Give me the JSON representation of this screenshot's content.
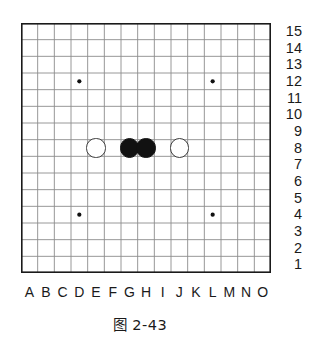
{
  "figure": {
    "caption": "图 2-43",
    "kind": "go-board-diagram"
  },
  "board": {
    "columns": 15,
    "rows": 15,
    "column_labels": [
      "A",
      "B",
      "C",
      "D",
      "E",
      "F",
      "G",
      "H",
      "I",
      "J",
      "K",
      "L",
      "M",
      "N",
      "O"
    ],
    "row_labels": [
      "15",
      "14",
      "13",
      "12",
      "11",
      "10",
      "9",
      "8",
      "7",
      "6",
      "5",
      "4",
      "3",
      "2",
      "1"
    ],
    "border_color": "#1a1a1a",
    "grid_color": "#8c8c8c",
    "background_color": "#ffffff"
  },
  "star_points": [
    {
      "name": "star-point-d12",
      "col": "D",
      "row": "12"
    },
    {
      "name": "star-point-l12",
      "col": "L",
      "row": "12"
    },
    {
      "name": "star-point-d4",
      "col": "D",
      "row": "4"
    },
    {
      "name": "star-point-l4",
      "col": "L",
      "row": "4"
    }
  ],
  "stones": [
    {
      "name": "white-stone-e8",
      "color": "white",
      "col": "E",
      "row": "8"
    },
    {
      "name": "black-stone-g8",
      "color": "black",
      "col": "G",
      "row": "8"
    },
    {
      "name": "black-stone-h8",
      "color": "black",
      "col": "H",
      "row": "8"
    },
    {
      "name": "white-stone-j8",
      "color": "white",
      "col": "J",
      "row": "8"
    }
  ],
  "colors": {
    "black_stone": "#111111",
    "white_stone_fill": "#ffffff",
    "white_stone_border": "#3a3a3a",
    "text": "#1a1a1a"
  }
}
